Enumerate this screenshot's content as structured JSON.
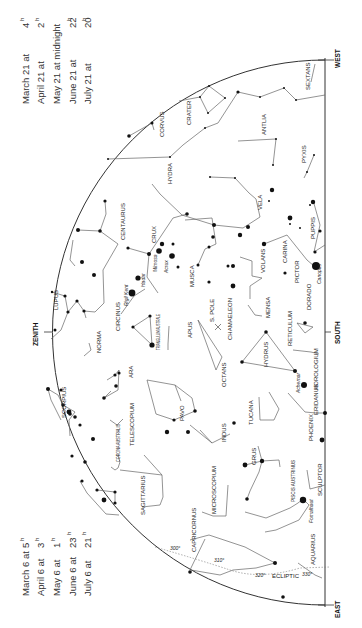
{
  "schedule_top": {
    "rows": [
      {
        "date": "March 21 at",
        "time": "4",
        "unit": "h"
      },
      {
        "date": "April 21 at",
        "time": "2",
        "unit": "h"
      },
      {
        "date": "May 21 at midnight",
        "time": "",
        "unit": ""
      },
      {
        "date": "June 21 at",
        "time": "22",
        "unit": "h"
      },
      {
        "date": "July 21 at",
        "time": "20",
        "unit": "h"
      }
    ]
  },
  "schedule_bottom": {
    "rows": [
      {
        "date": "March 6 at",
        "time": "5",
        "unit": "h"
      },
      {
        "date": "April 6 at",
        "time": "3",
        "unit": "h"
      },
      {
        "date": "May 6 at",
        "time": "1",
        "unit": "h"
      },
      {
        "date": "June 6 at",
        "time": "23",
        "unit": "h"
      },
      {
        "date": "July 6 at",
        "time": "21",
        "unit": "h"
      }
    ]
  },
  "directions": {
    "zenith": "ZENITH",
    "west": "WEST",
    "south": "SOUTH",
    "east": "EAST"
  },
  "pole_label": "S. POLE",
  "ecliptic": {
    "label": "ECLIPTIC",
    "degree_marks": [
      "300°",
      "310°",
      "320°",
      "330°"
    ]
  },
  "constellations": [
    "SEXTANS",
    "CRATER",
    "CORVUS",
    "ANTLIA",
    "HYDRA",
    "PYXIS",
    "VELA",
    "PUPPIS",
    "CENTAURUS",
    "CRUX",
    "MUSCA",
    "CARINA",
    "VOLANS",
    "PICTOR",
    "DORADO",
    "LUPUS",
    "CIRCINUS",
    "NORMA",
    "TRIANGULUM AUSTRALE",
    "APUS",
    "CHAMAELEON",
    "MENSA",
    "RETICULUM",
    "HYDRUS",
    "OCTANS",
    "ARA",
    "SCORPIUS",
    "TELESCOPIUM",
    "PAVO",
    "TUCANA",
    "HOROLOGIUM",
    "ERIDANUS",
    "PHOENIX",
    "INDUS",
    "CORONA AUSTRALIS",
    "GRUS",
    "SAGITTARIUS",
    "MICROSCOPIUM",
    "PISCIS AUSTRINUS",
    "SCULPTOR",
    "CAPRICORNUS",
    "AQUARIUS"
  ],
  "stars": {
    "hadar": "Hadar",
    "rigil_kent": "Rigil Kent",
    "mimosa": "Mimosa",
    "acrux": "Acrux",
    "canopus": "Canopus",
    "achernar": "Achernar",
    "fomalhaut": "Fomalhaut"
  }
}
